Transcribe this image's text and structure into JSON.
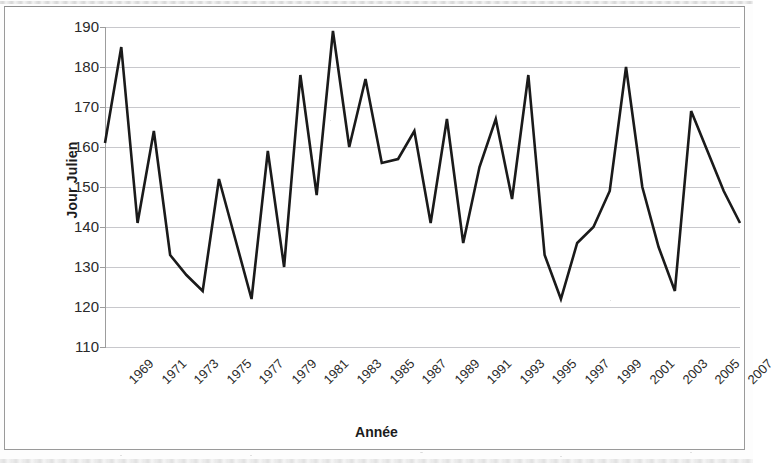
{
  "chart_data": {
    "type": "line",
    "title": "",
    "xlabel": "Année",
    "ylabel": "Jour Julien",
    "ylim": [
      110,
      190
    ],
    "ytick_step": 10,
    "yticks": [
      190,
      180,
      170,
      160,
      150,
      140,
      130,
      120,
      110
    ],
    "xticks": [
      "1969",
      "1971",
      "1973",
      "1975",
      "1977",
      "1979",
      "1981",
      "1983",
      "1985",
      "1987",
      "1989",
      "1991",
      "1993",
      "1995",
      "1997",
      "1999",
      "2001",
      "2003",
      "2005",
      "2007"
    ],
    "xlim": [
      1969,
      2008
    ],
    "grid": "horizontal",
    "legend": "none",
    "line_color": "#1a1a1a",
    "line_width": 2.6,
    "x": [
      1969,
      1970,
      1971,
      1972,
      1973,
      1974,
      1975,
      1976,
      1977,
      1978,
      1979,
      1980,
      1981,
      1982,
      1983,
      1984,
      1985,
      1986,
      1987,
      1988,
      1989,
      1990,
      1991,
      1992,
      1993,
      1994,
      1995,
      1996,
      1997,
      1998,
      1999,
      2000,
      2001,
      2002,
      2003,
      2004,
      2005,
      2006,
      2007,
      2008
    ],
    "values": [
      161,
      185,
      141,
      164,
      133,
      128,
      124,
      152,
      137,
      122,
      159,
      130,
      178,
      148,
      189,
      160,
      177,
      156,
      157,
      164,
      141,
      167,
      136,
      155,
      167,
      147,
      178,
      133,
      122,
      136,
      140,
      149,
      180,
      150,
      135,
      124,
      169,
      159,
      149,
      141
    ],
    "series": [
      {
        "name": "Jour Julien",
        "values": [
          161,
          185,
          141,
          164,
          133,
          128,
          124,
          152,
          137,
          122,
          159,
          130,
          178,
          148,
          189,
          160,
          177,
          156,
          157,
          164,
          141,
          167,
          136,
          155,
          167,
          147,
          178,
          133,
          122,
          136,
          140,
          149,
          180,
          150,
          135,
          124,
          169,
          159,
          149,
          141
        ]
      }
    ]
  },
  "axes": {
    "y_title": "Jour Julien",
    "x_title": "Année"
  }
}
